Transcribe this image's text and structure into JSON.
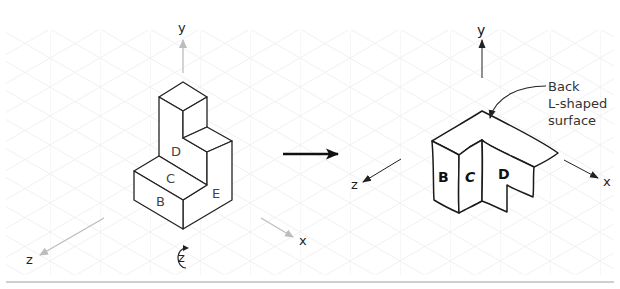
{
  "colors": {
    "grid": "#ececec",
    "axis_light": "#bdbdbd",
    "outline": "#222222",
    "divider": "#cfcfcf"
  },
  "left_view": {
    "axes": {
      "y_label": "y",
      "x_label": "x",
      "z_label": "z"
    },
    "rotation_label": "z",
    "faces": {
      "B": "B",
      "C": "C",
      "D": "D",
      "E": "E"
    }
  },
  "transition_arrow": "right-arrow",
  "right_view": {
    "axes": {
      "y_label": "y",
      "x_label": "x",
      "z_label": "z"
    },
    "faces": {
      "B": "B",
      "C": "C",
      "D": "D"
    },
    "callout": {
      "line1": "Back",
      "line2": "L-shaped",
      "line3": "surface"
    }
  }
}
